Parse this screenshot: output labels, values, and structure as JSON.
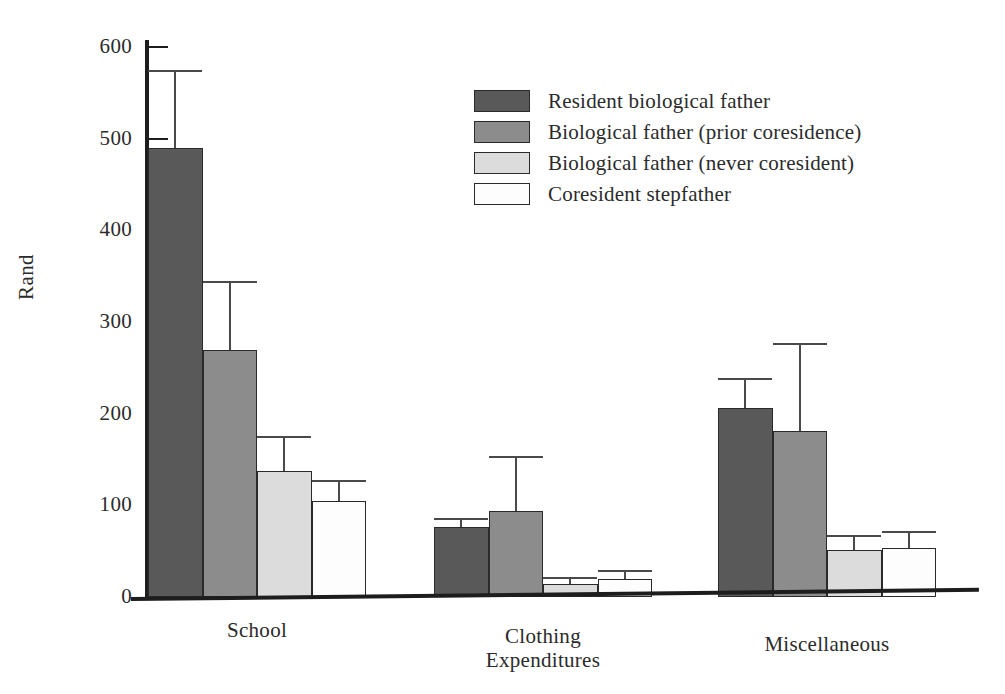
{
  "chart_data": {
    "type": "bar",
    "title": "",
    "xlabel": "Expenditures",
    "ylabel": "Rand",
    "categories": [
      "School",
      "Clothing",
      "Miscellaneous"
    ],
    "ylim": [
      0,
      600
    ],
    "yticks": [
      0,
      100,
      200,
      300,
      400,
      500,
      600
    ],
    "ytick_labels": [
      "0",
      "100",
      "200",
      "300",
      "400",
      "500",
      "600"
    ],
    "grid": false,
    "legend_position": "upper center",
    "series": [
      {
        "name": "Resident biological father",
        "color": "#595959",
        "values": [
          490,
          76,
          206
        ],
        "error_high": [
          575,
          86,
          239
        ]
      },
      {
        "name": "Biological father (prior coresidence)",
        "color": "#8c8c8c",
        "values": [
          270,
          94,
          181
        ],
        "error_high": [
          345,
          154,
          277
        ]
      },
      {
        "name": "Biological father (never coresident)",
        "color": "#dcdcdc",
        "values": [
          137,
          14,
          51
        ],
        "error_high": [
          176,
          22,
          68
        ]
      },
      {
        "name": "Coresident stepfather",
        "color": "#fdfdfd",
        "values": [
          105,
          20,
          54
        ],
        "error_high": [
          128,
          30,
          72
        ]
      }
    ]
  },
  "axis": {
    "y_title": "Rand",
    "x_title": "Expenditures"
  }
}
